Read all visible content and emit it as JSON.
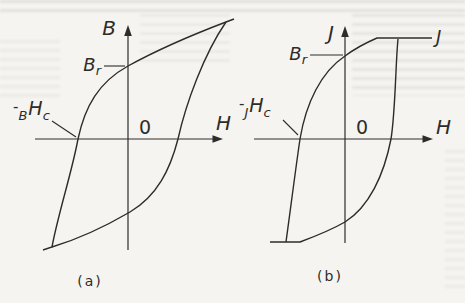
{
  "colors": {
    "ink": "#2e2c29",
    "paper": "#f5f4f1"
  },
  "figure": {
    "panels": [
      {
        "caption": "(a)",
        "y_axis_label": "B",
        "x_axis_label": "H",
        "origin_label": "0",
        "remanence_label": {
          "main": "B",
          "sub": "r"
        },
        "coercivity_label": {
          "minus": "-",
          "presub": "B",
          "main": "H",
          "sub": "c"
        }
      },
      {
        "caption": "(b)",
        "y_axis_label": "J",
        "x_axis_label": "H",
        "origin_label": "0",
        "saturation_label": "J",
        "remanence_label": {
          "main": "B",
          "sub": "r"
        },
        "coercivity_label": {
          "minus": "-",
          "presub": "J",
          "main": "H",
          "sub": "c"
        }
      }
    ]
  }
}
